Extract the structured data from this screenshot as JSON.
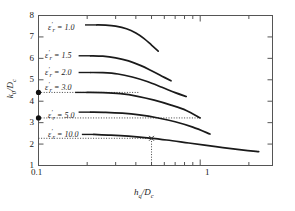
{
  "chart_data": {
    "type": "line",
    "title": "",
    "xlabel": "h_q/D_c",
    "ylabel": "k_0/D_c",
    "xscale": "log",
    "yscale": "linear",
    "xlim": [
      0.1,
      2.8
    ],
    "ylim": [
      1,
      8
    ],
    "grid": false,
    "legend_position": "inline-left-of-curves",
    "xticks_major": [
      {
        "value": 0.1,
        "label": "0.1"
      },
      {
        "value": 1,
        "label": "1"
      }
    ],
    "xticks_minor": [
      0.2,
      0.3,
      0.4,
      0.5,
      0.6,
      0.7,
      0.8,
      0.9,
      2
    ],
    "yticks": [
      {
        "value": 8,
        "label": "8"
      },
      {
        "value": 7,
        "label": "7"
      },
      {
        "value": 6,
        "label": "6"
      },
      {
        "value": 5,
        "label": "5"
      },
      {
        "value": 4,
        "label": "4"
      },
      {
        "value": 3,
        "label": "3"
      },
      {
        "value": 2,
        "label": "2"
      },
      {
        "value": 1,
        "label": "1"
      }
    ],
    "series": [
      {
        "name": "eps_r = 1.0",
        "label": "1.0",
        "points": [
          [
            0.23,
            7.56
          ],
          [
            0.26,
            7.55
          ],
          [
            0.3,
            7.5
          ],
          [
            0.35,
            7.38
          ],
          [
            0.4,
            7.18
          ],
          [
            0.45,
            6.92
          ],
          [
            0.5,
            6.62
          ],
          [
            0.55,
            6.34
          ]
        ]
      },
      {
        "name": "eps_r = 1.5",
        "label": "1.5",
        "points": [
          [
            0.21,
            6.12
          ],
          [
            0.25,
            6.1
          ],
          [
            0.3,
            6.02
          ],
          [
            0.36,
            5.88
          ],
          [
            0.43,
            5.66
          ],
          [
            0.5,
            5.42
          ],
          [
            0.58,
            5.17
          ],
          [
            0.66,
            4.95
          ]
        ]
      },
      {
        "name": "eps_r = 2.0",
        "label": "2.0",
        "points": [
          [
            0.21,
            5.34
          ],
          [
            0.25,
            5.33
          ],
          [
            0.31,
            5.27
          ],
          [
            0.38,
            5.13
          ],
          [
            0.47,
            4.92
          ],
          [
            0.58,
            4.65
          ],
          [
            0.7,
            4.4
          ],
          [
            0.82,
            4.22
          ]
        ]
      },
      {
        "name": "eps_r = 3.0",
        "label": "3.0",
        "points": [
          [
            0.2,
            4.41
          ],
          [
            0.25,
            4.4
          ],
          [
            0.32,
            4.35
          ],
          [
            0.41,
            4.23
          ],
          [
            0.52,
            4.05
          ],
          [
            0.66,
            3.82
          ],
          [
            0.82,
            3.57
          ],
          [
            1.0,
            3.22
          ]
        ]
      },
      {
        "name": "eps_r = 5.0",
        "label": "5.0",
        "points": [
          [
            0.21,
            3.49
          ],
          [
            0.26,
            3.48
          ],
          [
            0.33,
            3.44
          ],
          [
            0.42,
            3.36
          ],
          [
            0.54,
            3.23
          ],
          [
            0.7,
            3.04
          ],
          [
            0.9,
            2.79
          ],
          [
            1.15,
            2.47
          ]
        ]
      },
      {
        "name": "eps_r = 10.0",
        "label": "10.0",
        "points": [
          [
            0.22,
            2.45
          ],
          [
            0.28,
            2.42
          ],
          [
            0.36,
            2.37
          ],
          [
            0.47,
            2.29
          ],
          [
            0.62,
            2.19
          ],
          [
            0.85,
            2.05
          ],
          [
            1.25,
            1.88
          ],
          [
            1.8,
            1.73
          ],
          [
            2.3,
            1.65
          ]
        ]
      }
    ],
    "markers": [
      {
        "name": "y-axis-marker-upper",
        "x": 0.1,
        "y": 4.41,
        "shape": "filled-circle"
      },
      {
        "name": "y-axis-marker-lower",
        "x": 0.1,
        "y": 3.22,
        "shape": "filled-circle"
      },
      {
        "name": "curve-marker-cross",
        "x": 0.5,
        "y": 2.27,
        "shape": "cross"
      }
    ],
    "reference_lines": [
      {
        "name": "dotted-hline-4.41",
        "orientation": "horizontal",
        "y": 4.41,
        "x_from": 0.1,
        "x_to": 0.42,
        "style": "dotted"
      },
      {
        "name": "dotted-hline-3.22",
        "orientation": "horizontal",
        "y": 3.22,
        "x_from": 0.1,
        "x_to": 1.0,
        "style": "dotted"
      },
      {
        "name": "dotted-hline-2.27",
        "orientation": "horizontal",
        "y": 2.27,
        "x_from": 0.1,
        "x_to": 0.5,
        "style": "dotted"
      },
      {
        "name": "dotted-vline-0.5",
        "orientation": "vertical",
        "x": 0.5,
        "y_from": 1.0,
        "y_to": 2.27,
        "style": "dotted"
      }
    ],
    "curve_labels": [
      {
        "series": "eps_r = 1.0",
        "text_prefix": "ε",
        "prime": "′",
        "sub": "r",
        "eq": " = ",
        "value": "1.0"
      },
      {
        "series": "eps_r = 1.5",
        "text_prefix": "ε",
        "prime": "′",
        "sub": "r",
        "eq": " = ",
        "value": "1.5"
      },
      {
        "series": "eps_r = 2.0",
        "text_prefix": "ε",
        "prime": "′",
        "sub": "r",
        "eq": " = ",
        "value": "2.0"
      },
      {
        "series": "eps_r = 3.0",
        "text_prefix": "ε",
        "prime": "′",
        "sub": "r",
        "eq": " = ",
        "value": "3.0"
      },
      {
        "series": "eps_r = 5.0",
        "text_prefix": "ε",
        "prime": "′",
        "sub": "r",
        "eq": " = ",
        "value": "5.0"
      },
      {
        "series": "eps_r = 10.0",
        "text_prefix": "ε",
        "prime": "′",
        "sub": "r",
        "eq": " = ",
        "value": "10.0"
      }
    ],
    "colors": {
      "curve": "#1a1a1a",
      "axis": "#555555",
      "text": "#1a1a1a",
      "dotted": "#444444"
    }
  },
  "axis": {
    "x_label_main": "h",
    "x_label_sub1": "q",
    "x_label_mid": "/D",
    "x_label_sub2": "c",
    "y_label_main": "k",
    "y_label_sub1": "0",
    "y_label_mid": "/D",
    "y_label_sub2": "c"
  },
  "ticklabels": {
    "y": [
      "8",
      "7",
      "6",
      "5",
      "4",
      "3",
      "2",
      "1"
    ],
    "x": [
      "0.1",
      "1"
    ]
  },
  "curvelabels": {
    "c1": "1.0",
    "c2": "1.5",
    "c3": "2.0",
    "c4": "3.0",
    "c5": "5.0",
    "c6": "10.0"
  }
}
